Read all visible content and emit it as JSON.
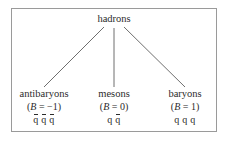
{
  "figure": {
    "kind": "tree-diagram",
    "border_color": "#9a9a9a",
    "text_color": "#2b2b2b",
    "background_color": "#ffffff"
  },
  "root": {
    "label": "hadrons"
  },
  "branches": [
    {
      "id": "antibaryons",
      "name": "antibaryons",
      "baryon_number_open": "(",
      "baryon_number_symbol": "B",
      "baryon_number_equals": " = ",
      "baryon_number_value": "−1",
      "baryon_number_close": ")",
      "baryon_number_text": "(B = −1)",
      "quark_content_text": "q̄ q̄ q̄",
      "quark_slots": [
        {
          "glyph": "q",
          "antiparticle": true
        },
        {
          "glyph": "q",
          "antiparticle": true
        },
        {
          "glyph": "q",
          "antiparticle": true
        }
      ]
    },
    {
      "id": "mesons",
      "name": "mesons",
      "baryon_number_open": "(",
      "baryon_number_symbol": "B",
      "baryon_number_equals": " = ",
      "baryon_number_value": "0",
      "baryon_number_close": ")",
      "baryon_number_text": "(B = 0)",
      "quark_content_text": "q q̄",
      "quark_slots": [
        {
          "glyph": "q",
          "antiparticle": false
        },
        {
          "glyph": "q",
          "antiparticle": true
        }
      ]
    },
    {
      "id": "baryons",
      "name": "baryons",
      "baryon_number_open": "(",
      "baryon_number_symbol": "B",
      "baryon_number_equals": " = ",
      "baryon_number_value": "1",
      "baryon_number_close": ")",
      "baryon_number_text": "(B = 1)",
      "quark_content_text": "q q q",
      "quark_slots": [
        {
          "glyph": "q",
          "antiparticle": false
        },
        {
          "glyph": "q",
          "antiparticle": false
        },
        {
          "glyph": "q",
          "antiparticle": false
        }
      ]
    }
  ],
  "edges": {
    "line_color": "#6f6f6f",
    "segments": [
      {
        "id": "edge-to-antibaryons",
        "x1": 104,
        "y1": 27,
        "x2": 44,
        "y2": 87
      },
      {
        "id": "edge-to-mesons",
        "x1": 114,
        "y1": 28,
        "x2": 114,
        "y2": 87
      },
      {
        "id": "edge-to-baryons",
        "x1": 124,
        "y1": 27,
        "x2": 185,
        "y2": 87
      }
    ]
  }
}
